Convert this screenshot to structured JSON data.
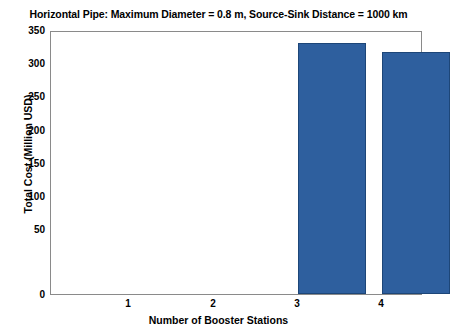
{
  "chart_data": {
    "type": "bar",
    "title": "Horizontal Pipe: Maximum Diameter = 0.8 m, Source-Sink Distance = 1000 km",
    "xlabel": "Number of Booster Stations",
    "ylabel": "Total Cost (Million USD)",
    "categories": [
      "1",
      "2",
      "3",
      "4"
    ],
    "values": [
      0,
      0,
      333,
      321
    ],
    "series": [
      {
        "name": "Total Cost",
        "values": [
          0,
          0,
          333,
          321
        ]
      }
    ],
    "ylim": [
      0,
      350
    ],
    "yticks": [
      0,
      50,
      100,
      150,
      200,
      250,
      300,
      350
    ],
    "ytick_labels": [
      "0",
      "50",
      "100",
      "150",
      "200",
      "250",
      "300",
      "350"
    ],
    "xtick_labels": [
      "1",
      "2",
      "3",
      "4"
    ],
    "grid": false,
    "legend": null,
    "bar_color": "#2E5F9E",
    "axis_color": "#8a8a8a",
    "background_color": "#ffffff"
  }
}
